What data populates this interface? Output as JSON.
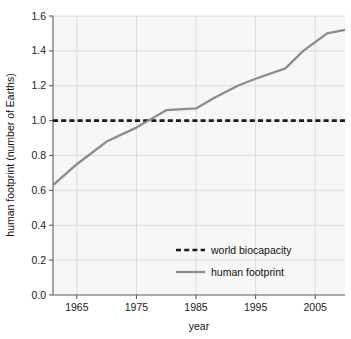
{
  "chart_data": {
    "type": "line",
    "title": "",
    "xlabel": "year",
    "ylabel": "human footprint (number of Earths)",
    "xlim": [
      1961,
      2010
    ],
    "ylim": [
      0.0,
      1.6
    ],
    "grid": true,
    "legend_position": "lower-center-right",
    "xticks": [
      1965,
      1975,
      1985,
      1995,
      2005
    ],
    "xtick_labels": [
      "1965",
      "1975",
      "1985",
      "1995",
      "2005"
    ],
    "yticks": [
      0.0,
      0.2,
      0.4,
      0.6,
      0.8,
      1.0,
      1.2,
      1.4,
      1.6
    ],
    "ytick_labels": [
      "0.0",
      "0.2",
      "0.4",
      "0.6",
      "0.8",
      "1.0",
      "1.2",
      "1.4",
      "1.6"
    ],
    "series": [
      {
        "name": "world biocapacity",
        "style": "dashed",
        "color": "#1a1a1a",
        "x": [
          1961,
          2010
        ],
        "values": [
          1.0,
          1.0
        ]
      },
      {
        "name": "human footprint",
        "style": "solid",
        "color": "#8c8c8c",
        "x": [
          1961,
          1965,
          1970,
          1975,
          1977,
          1980,
          1985,
          1988,
          1992,
          1995,
          2000,
          2003,
          2007,
          2010
        ],
        "values": [
          0.63,
          0.75,
          0.88,
          0.96,
          1.0,
          1.06,
          1.07,
          1.13,
          1.2,
          1.24,
          1.3,
          1.4,
          1.5,
          1.52
        ]
      }
    ]
  },
  "axes": {
    "ylabel": "human footprint (number of Earths)",
    "xlabel": "year"
  },
  "legend": {
    "entries": [
      {
        "label": "world biocapacity",
        "swatch": "dashed-line-swatch"
      },
      {
        "label": "human footprint",
        "swatch": "solid-line-swatch"
      }
    ]
  },
  "colors": {
    "figure_background": "#ffffff",
    "plot_background": "#f7f7f7",
    "grid": "#d8d8d8",
    "axis": "#5a5a5a",
    "biocapacity_line": "#1a1a1a",
    "footprint_line": "#8c8c8c"
  }
}
